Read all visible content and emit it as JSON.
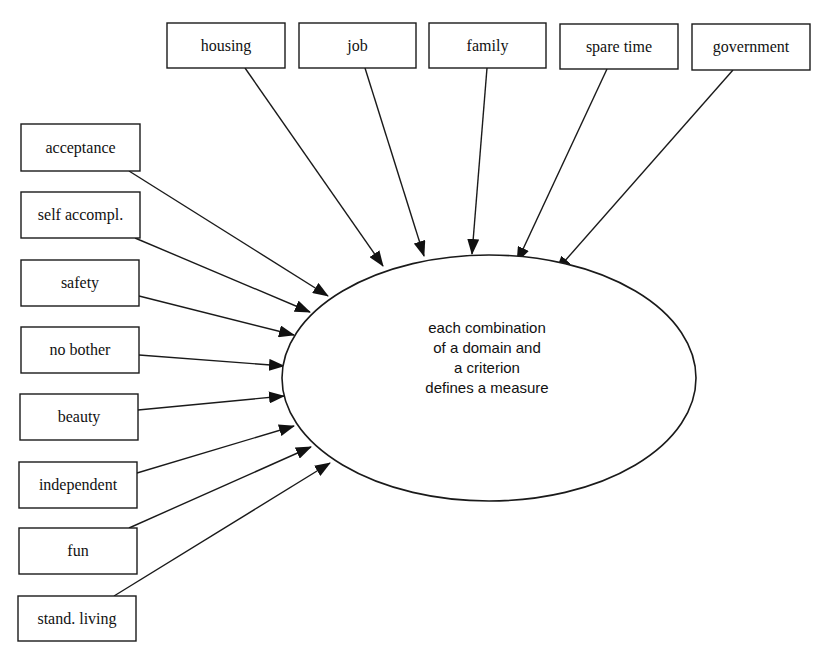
{
  "diagram": {
    "domains_label": "domains",
    "criteria_label": "criteria",
    "domains": [
      {
        "label": "housing",
        "x": 167,
        "y": 23,
        "w": 118,
        "h": 45
      },
      {
        "label": "job",
        "x": 299,
        "y": 23,
        "w": 117,
        "h": 45
      },
      {
        "label": "family",
        "x": 429,
        "y": 23,
        "w": 117,
        "h": 45
      },
      {
        "label": "spare time",
        "x": 560,
        "y": 24,
        "w": 118,
        "h": 45
      },
      {
        "label": "government",
        "x": 692,
        "y": 24,
        "w": 118,
        "h": 46
      }
    ],
    "criteria": [
      {
        "label": "acceptance",
        "x": 21,
        "y": 124,
        "w": 119,
        "h": 47
      },
      {
        "label": "self accompl.",
        "x": 21,
        "y": 192,
        "w": 119,
        "h": 46
      },
      {
        "label": "safety",
        "x": 21,
        "y": 260,
        "w": 118,
        "h": 46
      },
      {
        "label": "no bother",
        "x": 21,
        "y": 327,
        "w": 118,
        "h": 46
      },
      {
        "label": "beauty",
        "x": 20,
        "y": 394,
        "w": 118,
        "h": 46
      },
      {
        "label": "independent",
        "x": 19,
        "y": 462,
        "w": 118,
        "h": 46
      },
      {
        "label": "fun",
        "x": 19,
        "y": 528,
        "w": 118,
        "h": 46
      },
      {
        "label": "stand. living",
        "x": 18,
        "y": 596,
        "w": 118,
        "h": 45
      }
    ],
    "center": {
      "cx": 489,
      "cy": 378,
      "rx": 207,
      "ry": 123,
      "lines": [
        "each combination",
        "of a domain and",
        "a criterion",
        "defines a measure"
      ]
    },
    "domain_edges": [
      {
        "from": [
          245,
          68
        ],
        "to": [
          383,
          266
        ]
      },
      {
        "from": [
          365,
          68
        ],
        "to": [
          424,
          256
        ]
      },
      {
        "from": [
          487,
          68
        ],
        "to": [
          472,
          254
        ]
      },
      {
        "from": [
          607,
          69
        ],
        "to": [
          517,
          262
        ]
      },
      {
        "from": [
          733,
          70
        ],
        "to": [
          556,
          271
        ]
      }
    ],
    "criteria_edges": [
      {
        "from": [
          129,
          171
        ],
        "to": [
          328,
          296
        ]
      },
      {
        "from": [
          135,
          238
        ],
        "to": [
          310,
          312
        ]
      },
      {
        "from": [
          139,
          296
        ],
        "to": [
          294,
          335
        ]
      },
      {
        "from": [
          139,
          355
        ],
        "to": [
          284,
          366
        ]
      },
      {
        "from": [
          138,
          410
        ],
        "to": [
          284,
          396
        ]
      },
      {
        "from": [
          137,
          473
        ],
        "to": [
          294,
          426
        ]
      },
      {
        "from": [
          129,
          528
        ],
        "to": [
          311,
          447
        ]
      },
      {
        "from": [
          114,
          596
        ],
        "to": [
          330,
          463
        ]
      }
    ],
    "colors": {
      "stroke": "#1a1a1a",
      "background": "#ffffff",
      "text": "#111111"
    }
  }
}
